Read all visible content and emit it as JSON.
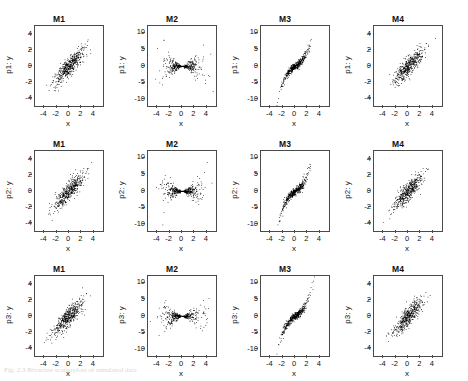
{
  "figure": {
    "caption": "Fig. 2.3  Bivariate scatterplots of simulated data"
  },
  "axes": {
    "xlabel": "x",
    "xticks": [
      "-4",
      "-2",
      "0",
      "2",
      "4"
    ],
    "yticks_small": [
      "4",
      "2",
      "0",
      "-2",
      "-4"
    ],
    "yticks_large": [
      "10",
      "5",
      "0",
      "-5",
      "-10"
    ]
  },
  "columns": [
    {
      "title": "M1",
      "pattern": "linear"
    },
    {
      "title": "M2",
      "pattern": "bowtie"
    },
    {
      "title": "M3",
      "pattern": "scurve"
    },
    {
      "title": "M4",
      "pattern": "linear"
    }
  ],
  "rows": [
    {
      "ylabel": "p1: y"
    },
    {
      "ylabel": "p2: y"
    },
    {
      "ylabel": "p3: y"
    }
  ],
  "panels": [
    {
      "title": "M1",
      "ylabel": "p1: y",
      "xlabel": "x"
    },
    {
      "title": "M2",
      "ylabel": "p1: y",
      "xlabel": "x"
    },
    {
      "title": "M3",
      "ylabel": "p1: y",
      "xlabel": "x"
    },
    {
      "title": "M4",
      "ylabel": "p1: y",
      "xlabel": "x"
    },
    {
      "title": "M1",
      "ylabel": "p2: y",
      "xlabel": "x"
    },
    {
      "title": "M2",
      "ylabel": "p2: y",
      "xlabel": "x"
    },
    {
      "title": "M3",
      "ylabel": "p2: y",
      "xlabel": "x"
    },
    {
      "title": "M4",
      "ylabel": "p2: y",
      "xlabel": "x"
    },
    {
      "title": "M1",
      "ylabel": "p3: y",
      "xlabel": "x"
    },
    {
      "title": "M2",
      "ylabel": "p3: y",
      "xlabel": "x"
    },
    {
      "title": "M3",
      "ylabel": "p3: y",
      "xlabel": "x"
    },
    {
      "title": "M4",
      "ylabel": "p3: y",
      "xlabel": "x"
    }
  ],
  "chart_data": {
    "type": "scatter",
    "layout": {
      "rows": 3,
      "cols": 4,
      "shared_x": true
    },
    "title": "",
    "xlabel": "x",
    "grid": false,
    "legend": null,
    "point_color": "#000000",
    "point_size": 1,
    "n_points_per_panel": 500,
    "xlim": [
      -5.5,
      5.5
    ],
    "panels": [
      {
        "row": 1,
        "col": 1,
        "title": "M1",
        "ylabel": "p1: y",
        "ylim": [
          -5,
          5
        ],
        "yticks": [
          -4,
          -2,
          0,
          2,
          4
        ],
        "xticks": [
          -4,
          -2,
          0,
          2,
          4
        ],
        "shape": "linear",
        "correlation": 0.85,
        "xspread": 1.2,
        "yspread": 1.1
      },
      {
        "row": 1,
        "col": 2,
        "title": "M2",
        "ylabel": "p1: y",
        "ylim": [
          -12,
          12
        ],
        "yticks": [
          -10,
          -5,
          0,
          5,
          10
        ],
        "xticks": [
          -4,
          -2,
          0,
          2,
          4
        ],
        "shape": "bowtie",
        "correlation": 0.0,
        "xspread": 1.5,
        "yspread": 1.0
      },
      {
        "row": 1,
        "col": 3,
        "title": "M3",
        "ylabel": "p1: y",
        "ylim": [
          -12,
          12
        ],
        "yticks": [
          -10,
          -5,
          0,
          5,
          10
        ],
        "xticks": [
          -4,
          -2,
          0,
          2,
          4
        ],
        "shape": "scurve",
        "correlation": 0.8,
        "xspread": 1.1,
        "yspread": 2.0
      },
      {
        "row": 1,
        "col": 4,
        "title": "M4",
        "ylabel": "p1: y",
        "ylim": [
          -5,
          5
        ],
        "yticks": [
          -4,
          -2,
          0,
          2,
          4
        ],
        "xticks": [
          -4,
          -2,
          0,
          2,
          4
        ],
        "shape": "linear",
        "correlation": 0.85,
        "xspread": 1.2,
        "yspread": 1.1
      },
      {
        "row": 2,
        "col": 1,
        "title": "M1",
        "ylabel": "p2: y",
        "ylim": [
          -5,
          5
        ],
        "yticks": [
          -4,
          -2,
          0,
          2,
          4
        ],
        "xticks": [
          -4,
          -2,
          0,
          2,
          4
        ],
        "shape": "linear",
        "correlation": 0.85,
        "xspread": 1.2,
        "yspread": 1.1
      },
      {
        "row": 2,
        "col": 2,
        "title": "M2",
        "ylabel": "p2: y",
        "ylim": [
          -12,
          12
        ],
        "yticks": [
          -10,
          -5,
          0,
          5,
          10
        ],
        "xticks": [
          -4,
          -2,
          0,
          2,
          4
        ],
        "shape": "bowtie",
        "correlation": 0.0,
        "xspread": 1.5,
        "yspread": 1.0
      },
      {
        "row": 2,
        "col": 3,
        "title": "M3",
        "ylabel": "p2: y",
        "ylim": [
          -12,
          12
        ],
        "yticks": [
          -10,
          -5,
          0,
          5,
          10
        ],
        "xticks": [
          -4,
          -2,
          0,
          2,
          4
        ],
        "shape": "scurve",
        "correlation": 0.8,
        "xspread": 1.1,
        "yspread": 2.0
      },
      {
        "row": 2,
        "col": 4,
        "title": "M4",
        "ylabel": "p2: y",
        "ylim": [
          -5,
          5
        ],
        "yticks": [
          -4,
          -2,
          0,
          2,
          4
        ],
        "xticks": [
          -4,
          -2,
          0,
          2,
          4
        ],
        "shape": "linear",
        "correlation": 0.85,
        "xspread": 1.2,
        "yspread": 1.1
      },
      {
        "row": 3,
        "col": 1,
        "title": "M1",
        "ylabel": "p3: y",
        "ylim": [
          -5,
          5
        ],
        "yticks": [
          -4,
          -2,
          0,
          2,
          4
        ],
        "xticks": [
          -4,
          -2,
          0,
          2,
          4
        ],
        "shape": "linear",
        "correlation": 0.85,
        "xspread": 1.2,
        "yspread": 1.1
      },
      {
        "row": 3,
        "col": 2,
        "title": "M2",
        "ylabel": "p3: y",
        "ylim": [
          -12,
          12
        ],
        "yticks": [
          -10,
          -5,
          0,
          5,
          10
        ],
        "xticks": [
          -4,
          -2,
          0,
          2,
          4
        ],
        "shape": "bowtie",
        "correlation": 0.0,
        "xspread": 1.5,
        "yspread": 1.0
      },
      {
        "row": 3,
        "col": 3,
        "title": "M3",
        "ylabel": "p3: y",
        "ylim": [
          -12,
          12
        ],
        "yticks": [
          -10,
          -5,
          0,
          5,
          10
        ],
        "xticks": [
          -4,
          -2,
          0,
          2,
          4
        ],
        "shape": "scurve",
        "correlation": 0.8,
        "xspread": 1.1,
        "yspread": 2.0
      },
      {
        "row": 3,
        "col": 4,
        "title": "M4",
        "ylabel": "p3: y",
        "ylim": [
          -5,
          5
        ],
        "yticks": [
          -4,
          -2,
          0,
          2,
          4
        ],
        "xticks": [
          -4,
          -2,
          0,
          2,
          4
        ],
        "shape": "linear",
        "correlation": 0.85,
        "xspread": 1.2,
        "yspread": 1.1
      }
    ]
  }
}
